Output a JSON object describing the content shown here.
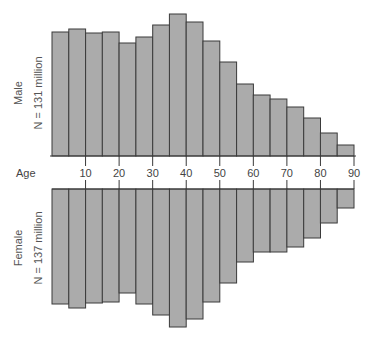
{
  "chart_data": {
    "type": "bar",
    "subtype": "population-pyramid (back-to-back histogram)",
    "title": "",
    "xlabel": "Age",
    "ylabel": "",
    "x_ticks": [
      10,
      20,
      30,
      40,
      50,
      60,
      70,
      80,
      90
    ],
    "bin_width": 5,
    "categories": [
      "0-5",
      "5-10",
      "10-15",
      "15-20",
      "20-25",
      "25-30",
      "30-35",
      "35-40",
      "40-45",
      "45-50",
      "50-55",
      "55-60",
      "60-65",
      "65-70",
      "70-75",
      "75-80",
      "80-85",
      "85-90"
    ],
    "value_note": "No y-axis shown; values are relative bar heights (pixels from the age axis)",
    "series": [
      {
        "name": "Male",
        "label": "N = 131 million",
        "direction": "up",
        "values": [
          124,
          127,
          123,
          124,
          113,
          119,
          131,
          142,
          134,
          115,
          94,
          72,
          61,
          57,
          49,
          38,
          23,
          11
        ]
      },
      {
        "name": "Female",
        "label": "N = 137 million",
        "direction": "down",
        "values": [
          115,
          119,
          114,
          113,
          104,
          115,
          126,
          138,
          130,
          113,
          94,
          73,
          63,
          63,
          58,
          49,
          34,
          19
        ]
      }
    ],
    "xlim": [
      0,
      90
    ],
    "grid": false,
    "legend": "none (panel labels at left)",
    "colors": {
      "bar_fill": "#ababab",
      "bar_stroke": "#3a3a3a"
    }
  },
  "labels": {
    "age_axis": "Age",
    "male_title": "Male",
    "male_count": "N = 131 million",
    "female_title": "Female",
    "female_count": "N = 137 million"
  }
}
